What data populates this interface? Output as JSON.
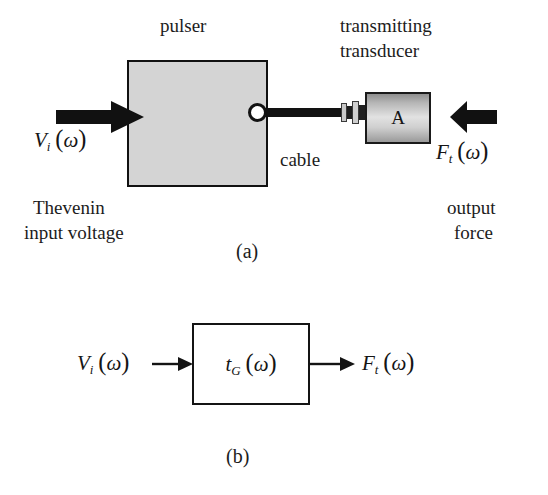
{
  "figure": {
    "panels": [
      {
        "id": "a",
        "caption": "(a)",
        "title_left": "pulser",
        "title_right_line1": "transmitting",
        "title_right_line2": "transducer",
        "cable_label": "cable",
        "transducer_letter": "A",
        "input_symbol": {
          "var": "V",
          "sub": "i",
          "arg": "ω"
        },
        "input_desc_line1": "Thevenin",
        "input_desc_line2": "input voltage",
        "output_symbol": {
          "var": "F",
          "sub": "t",
          "arg": "ω"
        },
        "output_desc_line1": "output",
        "output_desc_line2": "force",
        "arrows": [
          {
            "name": "input-arrow",
            "direction": "right"
          },
          {
            "name": "output-arrow",
            "direction": "left"
          }
        ]
      },
      {
        "id": "b",
        "caption": "(b)",
        "input_symbol": {
          "var": "V",
          "sub": "i",
          "arg": "ω"
        },
        "block_symbol": {
          "var": "t",
          "sub": "G",
          "arg": "ω"
        },
        "output_symbol": {
          "var": "F",
          "sub": "t",
          "arg": "ω"
        },
        "arrows": [
          {
            "name": "block-input-arrow",
            "direction": "right"
          },
          {
            "name": "block-output-arrow",
            "direction": "right"
          }
        ]
      }
    ],
    "colors": {
      "pulser_fill": "#d4d4d4",
      "stroke": "#111111",
      "cable": "#121212",
      "background": "#ffffff"
    }
  }
}
